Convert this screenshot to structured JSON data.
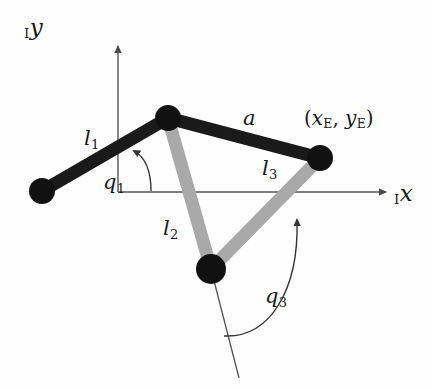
{
  "figure": {
    "type": "kinematic-linkage-diagram",
    "background_color": "#fefefe",
    "link_dark_color": "#1a1a1a",
    "link_light_color": "#a9a9a9",
    "joint_color": "#111111",
    "axis_color": "#555555",
    "arc_color": "#3a3a3a"
  },
  "axes": {
    "origin": {
      "x": 118,
      "y": 192
    },
    "x_axis": {
      "label_prefix": "I",
      "label": "x",
      "start": {
        "x": 118,
        "y": 192
      },
      "end": {
        "x": 392,
        "y": 192
      },
      "label_pos": {
        "x": 394,
        "y": 182
      }
    },
    "y_axis": {
      "label_prefix": "I",
      "label": "y",
      "start": {
        "x": 118,
        "y": 192
      },
      "end": {
        "x": 118,
        "y": 40
      },
      "label_pos": {
        "x": 24,
        "y": 16
      }
    }
  },
  "joints": [
    {
      "id": "base",
      "name": "base-joint",
      "x": 42,
      "y": 191,
      "r": 13,
      "color": "#111111"
    },
    {
      "id": "elbow",
      "name": "upper-joint",
      "x": 168,
      "y": 118,
      "r": 13,
      "color": "#111111"
    },
    {
      "id": "end_effector",
      "name": "end-effector-joint",
      "x": 320,
      "y": 158,
      "r": 13,
      "color": "#111111"
    },
    {
      "id": "lower",
      "name": "lower-joint",
      "x": 211,
      "y": 269,
      "r": 15,
      "color": "#111111"
    }
  ],
  "links": [
    {
      "id": "l1",
      "name": "link-l1",
      "label": "l",
      "subscript": "1",
      "from": "base",
      "to": "elbow",
      "color": "#1a1a1a",
      "width": 13,
      "label_pos": {
        "x": 84,
        "y": 128
      }
    },
    {
      "id": "a",
      "name": "link-a",
      "label": "a",
      "subscript": "",
      "from": "elbow",
      "to": "end_effector",
      "color": "#1a1a1a",
      "width": 13,
      "label_pos": {
        "x": 243,
        "y": 108
      }
    },
    {
      "id": "l2",
      "name": "link-l2",
      "label": "l",
      "subscript": "2",
      "from": "elbow",
      "to": "lower",
      "color": "#a9a9a9",
      "width": 13,
      "label_pos": {
        "x": 163,
        "y": 218
      }
    },
    {
      "id": "l3",
      "name": "link-l3",
      "label": "l",
      "subscript": "3",
      "from": "lower",
      "to": "end_effector",
      "color": "#a9a9a9",
      "width": 13,
      "label_pos": {
        "x": 262,
        "y": 158
      }
    }
  ],
  "angles": [
    {
      "id": "q1",
      "name": "angle-q1",
      "label": "q",
      "subscript": "1",
      "vertex": "base",
      "arc_path": "M 151 191 C 151 170, 145 157, 134 151",
      "arrow_at": {
        "x": 133,
        "y": 150
      },
      "arrow_angle": -120,
      "label_pos": {
        "x": 103,
        "y": 172
      }
    },
    {
      "id": "q3",
      "name": "angle-q3",
      "label": "q",
      "subscript": "3",
      "vertex": "lower",
      "arc_path": "M 224 336 C 270 338, 299 290, 297 220",
      "arrow_at": {
        "x": 296,
        "y": 214
      },
      "arrow_angle": -80,
      "label_pos": {
        "x": 265,
        "y": 286
      }
    }
  ],
  "reference_line": {
    "name": "lower-joint-reference-line",
    "from": {
      "x": 211,
      "y": 269
    },
    "to": {
      "x": 239,
      "y": 378
    },
    "color": "#555555",
    "width": 1.3
  },
  "annotations": [
    {
      "id": "ee_coords",
      "name": "end-effector-coordinates-label",
      "open_paren": "(",
      "x_sym": "x",
      "x_sub": "E",
      "comma": ", ",
      "y_sym": "y",
      "y_sub": "E",
      "close_paren": ")",
      "pos": {
        "x": 304,
        "y": 108
      }
    }
  ]
}
